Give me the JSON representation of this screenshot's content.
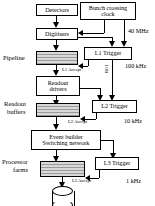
{
  "diagram": {
    "nodes": {
      "detectors": "Detectors",
      "bunch_clock_line1": "Bunch crossing",
      "bunch_clock_line2": "clock",
      "digitisers": "Digitisers",
      "l1_trigger": "L1 Trigger",
      "readout_drivers_line1": "Readout",
      "readout_drivers_line2": "drivers",
      "l2_trigger": "L2 Trigger",
      "event_builder_line1": "Event builder",
      "event_builder_line2": "Switching network",
      "l3_trigger": "L3 Trigger"
    },
    "side_labels": {
      "pipeline": "Pipeline",
      "readout_buffers_line1": "Readout",
      "readout_buffers_line2": "buffers",
      "processor_farms_line1": "Processor",
      "processor_farms_line2": "farms"
    },
    "rates": {
      "rate1": "40 MHz",
      "rate2": "100 kHz",
      "rate3": "10 kHz",
      "rate4": "1 kHz"
    },
    "edge_labels": {
      "l1_accept": "L1 Accept",
      "roi": "ROI",
      "l2_accept": "L2 Accept",
      "l3_accept": "L3 Accept"
    },
    "colors": {
      "stroke": "#000000",
      "background": "#ffffff",
      "stack_light": "#d9d9d9",
      "stack_dark": "#9a9a9a"
    }
  }
}
